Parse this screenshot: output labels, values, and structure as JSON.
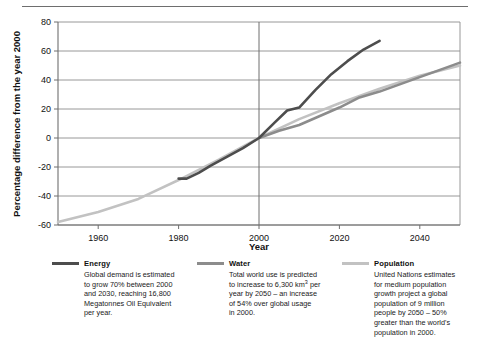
{
  "chart_data": {
    "type": "line",
    "title": "",
    "xlabel": "Year",
    "ylabel": "Percentage difference from the year 2000",
    "xlim": [
      1950,
      2050
    ],
    "ylim": [
      -60,
      80
    ],
    "xticks": [
      1960,
      1980,
      2000,
      2020,
      2040
    ],
    "yticks": [
      -60,
      -40,
      -20,
      0,
      20,
      40,
      60,
      80
    ],
    "grid": "horizontal-plus-2000-vertical",
    "legend_position": "below-chart",
    "series": [
      {
        "name": "Energy",
        "color": "#4d4d4d",
        "points": [
          [
            1980,
            -28
          ],
          [
            1982,
            -28
          ],
          [
            1985,
            -24
          ],
          [
            1988,
            -19
          ],
          [
            1992,
            -13
          ],
          [
            1996,
            -7
          ],
          [
            2000,
            0
          ],
          [
            2004,
            11
          ],
          [
            2007,
            19
          ],
          [
            2010,
            21
          ],
          [
            2014,
            33
          ],
          [
            2018,
            44
          ],
          [
            2022,
            53
          ],
          [
            2026,
            61
          ],
          [
            2030,
            67
          ]
        ]
      },
      {
        "name": "Water",
        "color": "#8c8c8c",
        "points": [
          [
            2000,
            0
          ],
          [
            2005,
            5
          ],
          [
            2010,
            9
          ],
          [
            2015,
            15
          ],
          [
            2020,
            21
          ],
          [
            2025,
            28
          ],
          [
            2030,
            32
          ],
          [
            2035,
            37
          ],
          [
            2040,
            42
          ],
          [
            2045,
            47
          ],
          [
            2050,
            52
          ]
        ]
      },
      {
        "name": "Population",
        "color": "#c2c2c2",
        "points": [
          [
            1950,
            -58
          ],
          [
            1960,
            -51
          ],
          [
            1970,
            -42
          ],
          [
            1980,
            -29
          ],
          [
            1990,
            -15
          ],
          [
            2000,
            0
          ],
          [
            2010,
            13
          ],
          [
            2020,
            24
          ],
          [
            2030,
            34
          ],
          [
            2040,
            43
          ],
          [
            2050,
            50
          ]
        ]
      }
    ]
  },
  "axes": {
    "y_title": "Percentage difference from the year 2000",
    "x_title": "Year",
    "y_ticks": [
      "80",
      "60",
      "40",
      "20",
      "0",
      "-20",
      "-40",
      "-60"
    ],
    "x_ticks": [
      "1960",
      "1980",
      "2000",
      "2020",
      "2040"
    ]
  },
  "legend": {
    "items": [
      {
        "key": "energy",
        "title": "Energy",
        "color": "#4d4d4d",
        "description_lines": [
          "Global demand is estimated",
          "to grow 70% between 2000",
          "and 2030, reaching 16,800",
          "Megatonnes Oil Equivalent",
          "per year."
        ]
      },
      {
        "key": "water",
        "title": "Water",
        "color": "#8c8c8c",
        "description_lines": [
          "Total world use is predicted",
          "to increase to 6,300 km³ per",
          "year by 2050 – an increase",
          "of 54% over global usage",
          "in 2000."
        ]
      },
      {
        "key": "population",
        "title": "Population",
        "color": "#c2c2c2",
        "description_lines": [
          "United Nations estimates",
          "for medium population",
          "growth project a global",
          "population of 9 million",
          "people by 2050 – 50%",
          "greater than the world's",
          "population in 2000."
        ]
      }
    ]
  }
}
